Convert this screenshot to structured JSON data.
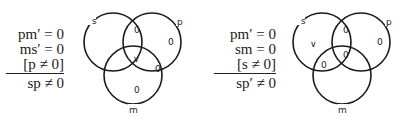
{
  "syllogisms": [
    {
      "premises": [
        "pm′ = 0",
        "ms′ = 0",
        "[p ≠ 0]"
      ],
      "conclusion": "sp ≠ 0",
      "diagram": {
        "circle_labels": {
          "s": "s",
          "p": "p",
          "m": "m"
        },
        "regions": {
          "s_p_not_m": "0",
          "p_only": "0",
          "s_p_m": "∨",
          "p_m_not_s": "0",
          "m_only": "0"
        }
      }
    },
    {
      "premises": [
        "pm′ = 0",
        "sm = 0",
        "[s ≠ 0]"
      ],
      "conclusion": "sp′ ≠ 0",
      "diagram": {
        "circle_labels": {
          "s": "s",
          "p": "p",
          "m": "m"
        },
        "regions": {
          "s_only": "∨",
          "s_p_not_m": "0",
          "p_only": "0",
          "s_m_not_p": "0",
          "s_p_m": "0"
        }
      }
    }
  ]
}
